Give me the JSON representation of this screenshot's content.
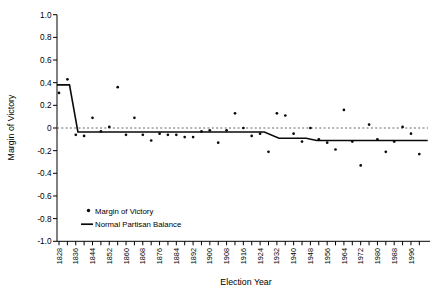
{
  "chart_data": {
    "type": "scatter",
    "title": "",
    "xlabel": "Election Year",
    "ylabel": "Margin of Victory",
    "ylim": [
      -1.0,
      1.0
    ],
    "y_tick_labels": [
      "1.0",
      "0.8",
      "0.6",
      "0.4",
      "0.2",
      "0",
      "-0.2",
      "-0.4",
      "-0.6",
      "-0.8",
      "-1.0"
    ],
    "y_tick_values": [
      1.0,
      0.8,
      0.6,
      0.4,
      0.2,
      0.0,
      -0.2,
      -0.4,
      -0.6,
      -0.8,
      -1.0
    ],
    "x_tick_labels": [
      "1828",
      "1836",
      "1844",
      "1852",
      "1860",
      "1868",
      "1876",
      "1884",
      "1892",
      "1900",
      "1908",
      "1916",
      "1924",
      "1932",
      "1940",
      "1948",
      "1956",
      "1964",
      "1972",
      "1980",
      "1988",
      "1996"
    ],
    "x_minor_tick_start": 1828,
    "x_minor_tick_end": 2000,
    "x_minor_tick_step": 4,
    "zero_reference_line": 0,
    "grid": "off",
    "legend_position": "inside lower-left",
    "series": [
      {
        "name": "Margin of Victory",
        "type": "scatter",
        "points": [
          [
            1828,
            0.31
          ],
          [
            1832,
            0.43
          ],
          [
            1836,
            -0.06
          ],
          [
            1840,
            -0.07
          ],
          [
            1844,
            0.09
          ],
          [
            1848,
            -0.03
          ],
          [
            1852,
            0.01
          ],
          [
            1856,
            0.36
          ],
          [
            1860,
            -0.06
          ],
          [
            1864,
            0.09
          ],
          [
            1868,
            -0.06
          ],
          [
            1872,
            -0.11
          ],
          [
            1876,
            -0.05
          ],
          [
            1880,
            -0.06
          ],
          [
            1884,
            -0.06
          ],
          [
            1888,
            -0.08
          ],
          [
            1892,
            -0.08
          ],
          [
            1896,
            -0.03
          ],
          [
            1900,
            -0.02
          ],
          [
            1904,
            -0.13
          ],
          [
            1908,
            -0.02
          ],
          [
            1912,
            0.13
          ],
          [
            1916,
            0.0
          ],
          [
            1920,
            -0.07
          ],
          [
            1924,
            -0.05
          ],
          [
            1928,
            -0.21
          ],
          [
            1932,
            0.13
          ],
          [
            1936,
            0.11
          ],
          [
            1940,
            -0.05
          ],
          [
            1944,
            -0.12
          ],
          [
            1948,
            0.0
          ],
          [
            1952,
            -0.1
          ],
          [
            1956,
            -0.13
          ],
          [
            1960,
            -0.19
          ],
          [
            1964,
            0.16
          ],
          [
            1968,
            -0.12
          ],
          [
            1972,
            -0.33
          ],
          [
            1976,
            0.03
          ],
          [
            1980,
            -0.1
          ],
          [
            1984,
            -0.21
          ],
          [
            1988,
            -0.12
          ],
          [
            1992,
            0.01
          ],
          [
            1996,
            -0.05
          ],
          [
            2000,
            -0.23
          ]
        ]
      },
      {
        "name": "Normal Partisan Balance",
        "type": "line",
        "points": [
          [
            1827,
            0.38
          ],
          [
            1833,
            0.38
          ],
          [
            1837,
            -0.035
          ],
          [
            1926,
            -0.035
          ],
          [
            1933,
            -0.09
          ],
          [
            1946,
            -0.09
          ],
          [
            1951,
            -0.11
          ],
          [
            2004,
            -0.11
          ]
        ]
      }
    ]
  },
  "colors": {
    "background": "#ffffff",
    "axis": "#000000",
    "point": "#0a0a0a",
    "balance_line": "#0a0a0a",
    "zero_dash": "#555555",
    "text": "#000000"
  }
}
